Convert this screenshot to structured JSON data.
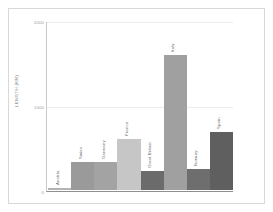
{
  "chart_data": {
    "type": "bar",
    "title": "",
    "subtitle": "",
    "xlabel": "",
    "ylabel": "LENGTH (KM)",
    "categories": [
      "Austria",
      "Swiss",
      "Germany",
      "France",
      "Great Britain",
      "Italy",
      "Norway",
      "Spain"
    ],
    "values": [
      20,
      330,
      335,
      600,
      230,
      1600,
      250,
      690
    ],
    "bar_colors": [
      "#b3b3b3",
      "#9a9a9a",
      "#a3a3a3",
      "#c6c6c6",
      "#6b6b6b",
      "#a0a0a0",
      "#6e6e6e",
      "#5f5f5f"
    ],
    "ylim": [
      0,
      2000
    ],
    "yticks": [
      0,
      1000,
      2000
    ],
    "ytick_labels": [
      "0",
      "1000",
      "2000"
    ],
    "grid": true,
    "grid_axis": "y",
    "legend": false,
    "legend_position": "none"
  },
  "axis": {
    "y_title": "LENGTH (KM)"
  },
  "colors": {
    "background": "#ffffff",
    "frame": "#d8d8d8",
    "gridline": "#ececec",
    "axis_line": "#8f8f8f",
    "tick_text": "#9a9a9a",
    "label_text": "#6f6f6f"
  }
}
